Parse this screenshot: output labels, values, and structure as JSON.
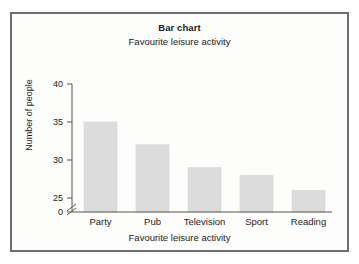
{
  "chart_data": {
    "type": "bar",
    "title": "Bar chart",
    "subtitle": "Favourite leisure activity",
    "xlabel": "Favourite leisure activity",
    "ylabel": "Number of people",
    "categories": [
      "Party",
      "Pub",
      "Television",
      "Sport",
      "Reading"
    ],
    "values": [
      35,
      32,
      29,
      28,
      26
    ],
    "ytick_labels": [
      "0",
      "25",
      "30",
      "35",
      "40"
    ],
    "ytick_values": [
      0,
      25,
      30,
      35,
      40
    ],
    "ylim": [
      0,
      40
    ],
    "axis_break": {
      "present": true,
      "between": [
        0,
        25
      ],
      "symbol": "zigzag"
    },
    "grid": false,
    "legend": false,
    "bar_color": "#dcdcdc",
    "axis_color": "#555555",
    "text_color": "#1b1b1b",
    "border_color": "#6e6e6e",
    "background_color": "#fdfdfb"
  }
}
